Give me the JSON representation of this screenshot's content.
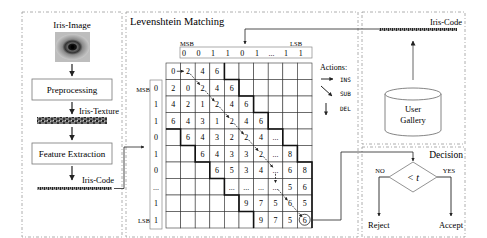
{
  "pipeline": {
    "iris_image_label": "Iris-Image",
    "preprocessing_label": "Preprocessing",
    "iris_texture_label": "Iris-Texture",
    "feature_extraction_label": "Feature Extraction",
    "iris_code_label": "Iris-Code"
  },
  "matching": {
    "title": "Levenshtein Matching",
    "top_code": {
      "msb_label": "MSB",
      "lsb_label": "LSB",
      "bits": [
        "0",
        "0",
        "1",
        "1",
        "0",
        "1",
        "...",
        "1",
        "1"
      ]
    },
    "side_code": {
      "msb_label": "MSB",
      "lsb_label": "LSB",
      "bits": [
        "0",
        "1",
        "1",
        "0",
        "1",
        "0",
        "...",
        "1",
        "1"
      ]
    },
    "grid": [
      [
        "0",
        "2",
        "4",
        "6",
        "",
        "",
        "",
        "",
        "",
        ""
      ],
      [
        "2",
        "0",
        "2",
        "4",
        "6",
        "",
        "",
        "",
        "",
        ""
      ],
      [
        "4",
        "2",
        "1",
        "2",
        "4",
        "6",
        "",
        "",
        "",
        ""
      ],
      [
        "6",
        "4",
        "3",
        "1",
        "2",
        "4",
        "6",
        "",
        "",
        ""
      ],
      [
        "",
        "6",
        "4",
        "3",
        "2",
        "2",
        "4",
        "...",
        "",
        ""
      ],
      [
        "",
        "",
        "6",
        "4",
        "3",
        "3",
        "2",
        "...",
        "8",
        ""
      ],
      [
        "",
        "",
        "",
        "6",
        "5",
        "3",
        "4",
        "...",
        "6",
        "8"
      ],
      [
        "",
        "",
        "",
        "",
        "...",
        "...",
        "...",
        "...",
        "5",
        "6"
      ],
      [
        "",
        "",
        "",
        "",
        "",
        "9",
        "7",
        "5",
        "6",
        "5"
      ],
      [
        "",
        "",
        "",
        "",
        "",
        "",
        "9",
        "7",
        "5",
        "6"
      ]
    ],
    "result_cell": "6",
    "actions": {
      "title": "Actions:",
      "ins": "INS",
      "sub": "SUB",
      "del": "DEL"
    }
  },
  "gallery": {
    "iris_code_label": "Iris-Code",
    "db_label_line1": "User",
    "db_label_line2": "Gallery"
  },
  "decision": {
    "title": "Decision",
    "condition": "< t",
    "no_label": "NO",
    "yes_label": "YES",
    "reject_label": "Reject",
    "accept_label": "Accept"
  },
  "colors": {
    "line": "#222222",
    "dashed_border": "#9a9a9a",
    "box_border": "#777777",
    "path_arrow": "#222222"
  }
}
